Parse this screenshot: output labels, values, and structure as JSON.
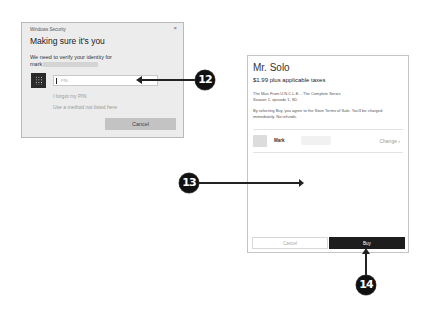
{
  "security_dialog": {
    "window_title": "Windows Security",
    "close_glyph": "×",
    "heading": "Making sure it's you",
    "message": "We need to verify your identity for",
    "account_prefix": "mark",
    "pin_icon": "pin-keypad-icon",
    "pin_input": {
      "value": "",
      "placeholder": "PIN"
    },
    "forgot_pin_link": "I forgot my PIN",
    "other_method_link": "Use a method not listed here",
    "cancel_label": "Cancel"
  },
  "purchase_dialog": {
    "title": "Mr. Solo",
    "price": "$1.99 plus applicable taxes",
    "description_line1": "The Man From U.N.C.L.E. - The Complete Series",
    "description_line2": "Season 1, episode 1, SD",
    "terms": "By selecting Buy, you agree to the Store Terms of Sale. You'll be charged immediately. No refunds.",
    "account": {
      "name": "Mark",
      "change_label": "Change",
      "change_glyph": "›"
    },
    "cancel_label": "Cancel",
    "buy_label": "Buy"
  },
  "callouts": [
    {
      "number": "12",
      "target": "pin-input"
    },
    {
      "number": "13",
      "target": "empty-area"
    },
    {
      "number": "14",
      "target": "buy-button"
    }
  ],
  "colors": {
    "callout_bg": "#111111",
    "buy_button": "#1d1d1d",
    "security_bg": "#ececec",
    "security_cancel": "#c3c3c3"
  }
}
